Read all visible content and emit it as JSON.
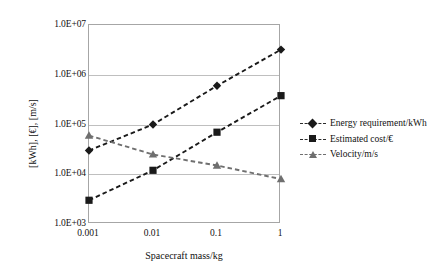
{
  "chart_data": {
    "type": "line",
    "title": "",
    "xlabel": "Spacecraft mass/kg",
    "ylabel": "[kWh], [€], [m/s]",
    "xscale": "log",
    "yscale": "log",
    "grid": true,
    "legend_position": "right",
    "x": [
      0.001,
      0.01,
      0.1,
      1
    ],
    "xticklabels": [
      "0.001",
      "0.01",
      "0.1",
      "1"
    ],
    "yticklabels": [
      "1.0E+07",
      "1.0E+06",
      "1.0E+05",
      "1.0E+04",
      "1.0E+03"
    ],
    "ylim": [
      1000,
      10000000
    ],
    "xlim": [
      0.001,
      1
    ],
    "series": [
      {
        "name": "Energy requirement/kWh",
        "marker": "diamond",
        "color": "#1a1a1a",
        "linestyle": "dashed",
        "values": [
          30000,
          100000,
          600000,
          3200000
        ]
      },
      {
        "name": "Estimated cost/€",
        "marker": "square",
        "color": "#1a1a1a",
        "linestyle": "dashed",
        "values": [
          3000,
          12000,
          70000,
          380000
        ]
      },
      {
        "name": "Velocity/m/s",
        "marker": "triangle",
        "color": "#6f6f6f",
        "linestyle": "dashed",
        "values": [
          60000,
          25000,
          15000,
          8000
        ]
      }
    ]
  },
  "legend": {
    "items": [
      {
        "label": "Energy requirement/kWh"
      },
      {
        "label": "Estimated cost/€"
      },
      {
        "label": "Velocity/m/s"
      }
    ]
  }
}
